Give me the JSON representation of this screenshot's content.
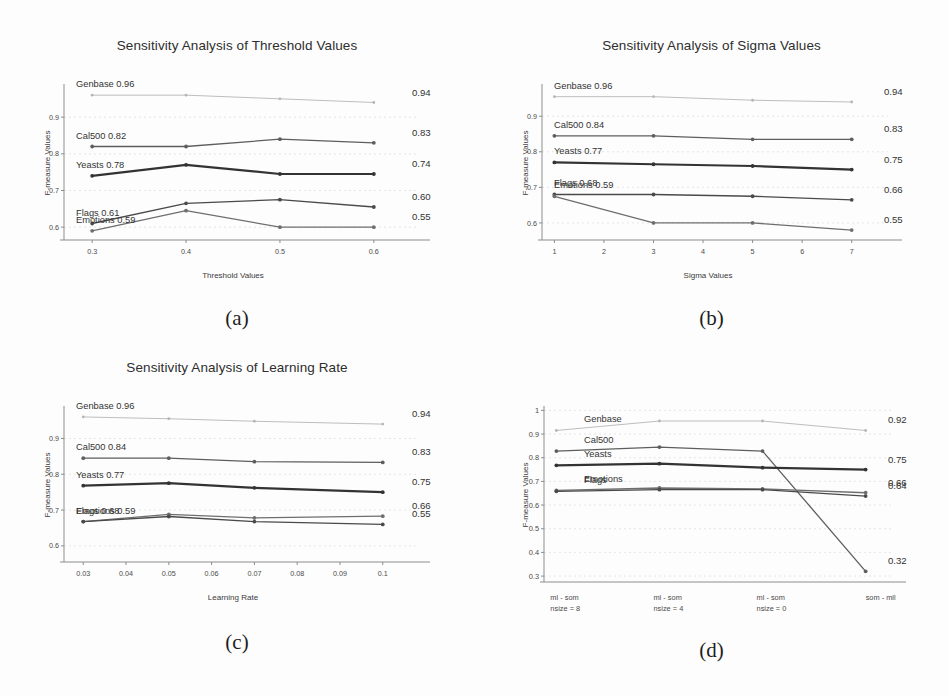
{
  "page": {
    "background": "#fdfdfd",
    "ink": "#333333"
  },
  "figure": {
    "captions": [
      "(a)",
      "(b)",
      "(c)",
      "(d)"
    ]
  },
  "series_names": [
    "Genbase",
    "Cal500",
    "Yeasts",
    "Flags",
    "Emotions"
  ],
  "series_colors": {
    "Genbase": "#b6b6b6",
    "Cal500": "#5e5e5e",
    "Yeasts": "#333333",
    "Flags": "#4a4a4a",
    "Emotions": "#6e6e6e"
  },
  "chart_data": [
    {
      "id": "a",
      "type": "line",
      "title": "Sensitivity Analysis of Threshold Values",
      "xlabel": "Threshold Values",
      "ylabel": "F-measure Values",
      "caption": "(a)",
      "x": [
        0.3,
        0.4,
        0.5,
        0.6
      ],
      "xticks": [
        "0.3",
        "0.4",
        "0.5",
        "0.6"
      ],
      "xlim": [
        0.27,
        0.63
      ],
      "ylim": [
        0.565,
        0.985
      ],
      "yticks": [
        0.6,
        0.7,
        0.8,
        0.9
      ],
      "yticklabels": [
        "0.6",
        "0.7",
        "0.8",
        "0.9"
      ],
      "grid": true,
      "series": [
        {
          "name": "Genbase",
          "values": [
            0.96,
            0.96,
            0.95,
            0.94
          ],
          "left_label": "Genbase 0.96",
          "right_label": "0.94"
        },
        {
          "name": "Cal500",
          "values": [
            0.82,
            0.82,
            0.84,
            0.83
          ],
          "left_label": "Cal500 0.82",
          "right_label": "0.83"
        },
        {
          "name": "Yeasts",
          "values": [
            0.74,
            0.77,
            0.745,
            0.745
          ],
          "left_label": "Yeasts 0.78",
          "right_label": "0.74"
        },
        {
          "name": "Flags",
          "values": [
            0.61,
            0.665,
            0.675,
            0.655
          ],
          "left_label": "Flags 0.61",
          "right_label": "0.60"
        },
        {
          "name": "Emotions",
          "values": [
            0.59,
            0.645,
            0.6,
            0.6
          ],
          "left_label": "Emotions 0.59",
          "right_label": "0.55"
        }
      ]
    },
    {
      "id": "b",
      "type": "line",
      "title": "Sensitivity Analysis of Sigma Values",
      "xlabel": "Sigma Values",
      "ylabel": "F-measure Values",
      "caption": "(b)",
      "x": [
        1,
        3,
        5,
        7
      ],
      "xticks": [
        "1",
        "2",
        "3",
        "4",
        "5",
        "6",
        "7"
      ],
      "xtickvals": [
        1,
        2,
        3,
        4,
        5,
        6,
        7
      ],
      "xlim": [
        0.75,
        7.45
      ],
      "ylim": [
        0.552,
        0.985
      ],
      "yticks": [
        0.6,
        0.7,
        0.8,
        0.9
      ],
      "yticklabels": [
        "0.6",
        "0.7",
        "0.8",
        "0.9"
      ],
      "grid": true,
      "series": [
        {
          "name": "Genbase",
          "values": [
            0.955,
            0.955,
            0.945,
            0.94
          ],
          "left_label": "Genbase 0.96",
          "right_label": "0.94"
        },
        {
          "name": "Cal500",
          "values": [
            0.845,
            0.845,
            0.835,
            0.835
          ],
          "left_label": "Cal500 0.84",
          "right_label": "0.83"
        },
        {
          "name": "Yeasts",
          "values": [
            0.77,
            0.765,
            0.76,
            0.75
          ],
          "left_label": "Yeasts 0.77",
          "right_label": "0.75"
        },
        {
          "name": "Flags",
          "values": [
            0.68,
            0.68,
            0.675,
            0.665
          ],
          "left_label": "Flags 0.68",
          "right_label": "0.66"
        },
        {
          "name": "Emotions",
          "values": [
            0.675,
            0.6,
            0.6,
            0.58
          ],
          "left_label": "Emotions 0.59",
          "right_label": "0.55"
        }
      ]
    },
    {
      "id": "c",
      "type": "line",
      "title": "Sensitivity Analysis of Learning Rate",
      "xlabel": "Learning Rate",
      "ylabel": "F-measure Values",
      "caption": "(c)",
      "x": [
        0.03,
        0.05,
        0.07,
        0.1
      ],
      "xticks": [
        "0.03",
        "0.04",
        "0.05",
        "0.06",
        "0.07",
        "0.08",
        "0.09",
        "0.1"
      ],
      "xtickvals": [
        0.03,
        0.04,
        0.05,
        0.06,
        0.07,
        0.08,
        0.09,
        0.1
      ],
      "xlim": [
        0.0255,
        0.1045
      ],
      "ylim": [
        0.555,
        0.985
      ],
      "yticks": [
        0.6,
        0.7,
        0.8,
        0.9
      ],
      "yticklabels": [
        "0.6",
        "0.7",
        "0.8",
        "0.9"
      ],
      "grid": true,
      "series": [
        {
          "name": "Genbase",
          "values": [
            0.96,
            0.955,
            0.948,
            0.94
          ],
          "left_label": "Genbase 0.96",
          "right_label": "0.94"
        },
        {
          "name": "Cal500",
          "values": [
            0.845,
            0.845,
            0.835,
            0.833
          ],
          "left_label": "Cal500 0.84",
          "right_label": "0.83"
        },
        {
          "name": "Yeasts",
          "values": [
            0.768,
            0.775,
            0.762,
            0.75
          ],
          "left_label": "Yeasts 0.77",
          "right_label": "0.75"
        },
        {
          "name": "Emotions",
          "values": [
            0.668,
            0.688,
            0.678,
            0.683
          ],
          "left_label": "Emotions 0.59",
          "right_label": "0.66"
        },
        {
          "name": "Flags",
          "values": [
            0.668,
            0.682,
            0.668,
            0.66
          ],
          "left_label": "Flags 0.68",
          "right_label": "0.55"
        }
      ]
    },
    {
      "id": "d",
      "type": "line",
      "title": "",
      "xlabel": "",
      "ylabel": "F-measure Values",
      "caption": "(d)",
      "x": [
        0,
        1,
        2,
        3
      ],
      "xticks": [
        "ml - som\nnsize = 8",
        "ml - som\nnsize = 4",
        "ml - som\nnsize = 0",
        "som - mll"
      ],
      "xtick_lines": [
        [
          "ml - som",
          "nsize = 8"
        ],
        [
          "ml - som",
          "nsize = 4"
        ],
        [
          "ml - som",
          "nsize = 0"
        ],
        [
          "som - mll",
          ""
        ]
      ],
      "xlim": [
        -0.12,
        3.12
      ],
      "ylim": [
        0.275,
        1.01
      ],
      "yticks": [
        0.3,
        0.4,
        0.5,
        0.6,
        0.7,
        0.8,
        0.9,
        1.0
      ],
      "yticklabels": [
        "0.3",
        "0.4",
        "0.5",
        "0.6",
        "0.7",
        "0.8",
        "0.9",
        "1"
      ],
      "grid": true,
      "series": [
        {
          "name": "Genbase",
          "values": [
            0.915,
            0.955,
            0.955,
            0.915
          ],
          "left_label": "Genbase",
          "right_label": "0.92"
        },
        {
          "name": "Cal500",
          "values": [
            0.828,
            0.845,
            0.828,
            0.32
          ],
          "left_label": "Cal500",
          "right_label": "0.32"
        },
        {
          "name": "Yeasts",
          "values": [
            0.768,
            0.775,
            0.758,
            0.75
          ],
          "left_label": "Yeasts",
          "right_label": "0.75"
        },
        {
          "name": "Emotions",
          "values": [
            0.662,
            0.672,
            0.668,
            0.652
          ],
          "left_label": "Emotions",
          "right_label": "0.66"
        },
        {
          "name": "Flags",
          "values": [
            0.658,
            0.665,
            0.665,
            0.638
          ],
          "left_label": "Flags",
          "right_label": "0.64"
        }
      ]
    }
  ]
}
